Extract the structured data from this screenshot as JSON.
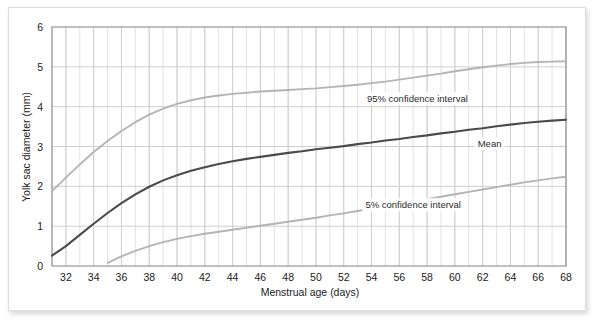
{
  "chart_data": {
    "type": "line",
    "title": "",
    "xlabel": "Menstrual age (days)",
    "ylabel": "Yolk sac diameter (mm)",
    "xlim": [
      31,
      68
    ],
    "ylim": [
      0,
      6
    ],
    "xticks": [
      32,
      34,
      36,
      38,
      40,
      42,
      44,
      46,
      48,
      50,
      52,
      54,
      56,
      58,
      60,
      62,
      64,
      66,
      68
    ],
    "yticks": [
      0,
      1,
      2,
      3,
      4,
      5,
      6
    ],
    "xtick_labels": [
      "32",
      "34",
      "36",
      "38",
      "40",
      "42",
      "44",
      "46",
      "48",
      "50",
      "52",
      "54",
      "56",
      "58",
      "60",
      "62",
      "64",
      "66",
      "68"
    ],
    "ytick_labels": [
      "0",
      "1",
      "2",
      "3",
      "4",
      "5",
      "6"
    ],
    "grid": true,
    "grid_minor_x_step": 1,
    "grid_major_y_step": 1,
    "legend_position": "inline-annotations",
    "x": [
      31,
      32,
      33,
      34,
      35,
      36,
      37,
      38,
      39,
      40,
      41,
      42,
      43,
      44,
      45,
      46,
      47,
      48,
      49,
      50,
      51,
      52,
      53,
      54,
      55,
      56,
      57,
      58,
      59,
      60,
      61,
      62,
      63,
      64,
      65,
      66,
      67,
      68
    ],
    "series": [
      {
        "name": "95% confidence interval",
        "color": "#b4b4b4",
        "values": [
          1.88,
          2.22,
          2.55,
          2.86,
          3.14,
          3.39,
          3.61,
          3.8,
          3.95,
          4.07,
          4.16,
          4.23,
          4.28,
          4.32,
          4.35,
          4.38,
          4.4,
          4.42,
          4.44,
          4.46,
          4.49,
          4.52,
          4.55,
          4.59,
          4.63,
          4.68,
          4.73,
          4.78,
          4.83,
          4.89,
          4.94,
          4.99,
          5.03,
          5.07,
          5.1,
          5.12,
          5.13,
          5.14
        ]
      },
      {
        "name": "Mean",
        "color": "#4a4a4a",
        "values": [
          0.26,
          0.5,
          0.78,
          1.06,
          1.33,
          1.58,
          1.8,
          1.99,
          2.15,
          2.28,
          2.39,
          2.48,
          2.56,
          2.63,
          2.69,
          2.74,
          2.79,
          2.84,
          2.88,
          2.93,
          2.97,
          3.01,
          3.06,
          3.1,
          3.15,
          3.19,
          3.24,
          3.28,
          3.33,
          3.37,
          3.42,
          3.46,
          3.51,
          3.55,
          3.59,
          3.62,
          3.65,
          3.67
        ]
      },
      {
        "name": "5% confidence interval",
        "color": "#b4b4b4",
        "values": [
          -0.62,
          -0.44,
          -0.26,
          -0.09,
          0.08,
          0.24,
          0.38,
          0.5,
          0.6,
          0.68,
          0.75,
          0.81,
          0.86,
          0.91,
          0.96,
          1.01,
          1.06,
          1.11,
          1.16,
          1.21,
          1.27,
          1.32,
          1.38,
          1.44,
          1.5,
          1.56,
          1.62,
          1.68,
          1.74,
          1.8,
          1.86,
          1.92,
          1.98,
          2.04,
          2.1,
          2.15,
          2.2,
          2.24
        ]
      }
    ],
    "annotations": [
      {
        "text": "95% confidence interval",
        "x": 57.3,
        "y": 4.12,
        "anchor": "middle"
      },
      {
        "text": "Mean",
        "x": 62.5,
        "y": 2.98,
        "anchor": "middle"
      },
      {
        "text": "5% confidence interval",
        "x": 57.0,
        "y": 1.45,
        "anchor": "middle"
      }
    ]
  },
  "style": {
    "plot_background": "#ffffff",
    "frame_color": "#8c8c8c",
    "major_grid_color": "#cfcfcf",
    "minor_grid_color": "#d9d9d9",
    "card_border": "#dedede",
    "text_color": "#1a1a1a"
  }
}
